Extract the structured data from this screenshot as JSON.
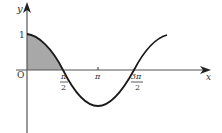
{
  "figure": {
    "function": "y = cos x",
    "axes": {
      "x_label": "x",
      "y_label": "y",
      "origin_label": "O"
    },
    "ticks": {
      "y_one": "1",
      "pi_half_num": "π",
      "pi_half_den": "2",
      "pi": "π",
      "three_pi_half_num": "3π",
      "three_pi_half_den": "2"
    },
    "shaded_region": "area under cos x from 0 to π/2",
    "colors": {
      "curve": "#1a1a1a",
      "axis": "#555555",
      "shade": "#a8a8a8"
    }
  }
}
